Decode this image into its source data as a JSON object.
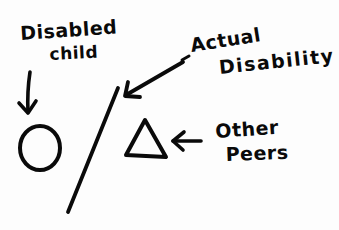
{
  "diagram": {
    "background": "#ffffff",
    "ink_color": "#0a0a0a",
    "labels": {
      "disabled_child": {
        "line1": "Disabled",
        "line2": "child"
      },
      "actual_disability": {
        "line1": "Actual",
        "line2": "Disability"
      },
      "other_peers": {
        "line1": "Other",
        "line2": "Peers"
      }
    },
    "shapes": [
      {
        "id": "circle",
        "represents": "Disabled child"
      },
      {
        "id": "slash-line",
        "represents": "Actual Disability"
      },
      {
        "id": "triangle",
        "represents": "Other Peers"
      }
    ],
    "arrows": [
      {
        "from": "Disabled child",
        "to": "circle",
        "direction": "down"
      },
      {
        "from": "Actual Disability",
        "to": "slash-line",
        "direction": "down-left"
      },
      {
        "from": "Other Peers",
        "to": "triangle",
        "direction": "left"
      }
    ]
  }
}
